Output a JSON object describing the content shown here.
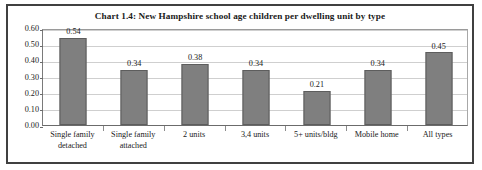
{
  "chart_data": {
    "type": "bar",
    "title": "Chart 1.4: New Hampshire school age children per dwelling unit by type",
    "xlabel": "",
    "ylabel": "",
    "ylim": [
      0.0,
      0.6
    ],
    "ytick_labels": [
      "0.60",
      "0.50",
      "0.40",
      "0.30",
      "0.20",
      "0.10",
      "0.00"
    ],
    "ytick_values": [
      0.6,
      0.5,
      0.4,
      0.3,
      0.2,
      0.1,
      0.0
    ],
    "grid": true,
    "legend": false,
    "bar_color": "#7f7f7f",
    "bar_edge_color": "#5d5d5d",
    "categories": [
      "Single family detached",
      "Single family attached",
      "2 units",
      "3,4 units",
      "5+ units/bldg",
      "Mobile home",
      "All types"
    ],
    "category_lines": [
      [
        "Single family",
        "detached"
      ],
      [
        "Single family",
        "attached"
      ],
      [
        "2 units",
        ""
      ],
      [
        "3,4 units",
        ""
      ],
      [
        "5+ units/bldg",
        ""
      ],
      [
        "Mobile home",
        ""
      ],
      [
        "All types",
        ""
      ]
    ],
    "values": [
      0.54,
      0.34,
      0.38,
      0.34,
      0.21,
      0.34,
      0.45
    ],
    "data_labels": [
      "0.54",
      "0.34",
      "0.38",
      "0.34",
      "0.21",
      "0.34",
      "0.45"
    ]
  }
}
